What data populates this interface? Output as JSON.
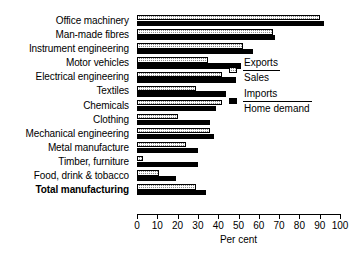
{
  "chart_data": {
    "type": "bar",
    "orientation": "horizontal",
    "title": "",
    "xlabel": "Per cent",
    "ylabel": "",
    "xlim": [
      0,
      100
    ],
    "xticks": [
      0,
      10,
      20,
      30,
      40,
      50,
      60,
      70,
      80,
      90,
      100
    ],
    "grid": false,
    "legend_position": "inside-right",
    "categories": [
      "Office machinery",
      "Man-made fibres",
      "Instrument engineering",
      "Motor vehicles",
      "Electrical engineering",
      "Textiles",
      "Chemicals",
      "Clothing",
      "Mechanical engineering",
      "Metal manufacture",
      "Timber, furniture",
      "Food, drink & tobacco",
      "Total manufacturing"
    ],
    "emphasized_categories": [
      "Total manufacturing"
    ],
    "series": [
      {
        "name": "Exports/Sales",
        "legend_numerator": "Exports",
        "legend_denominator": "Sales",
        "color": "#8a8a8a",
        "pattern": "hatched",
        "values": [
          90,
          67,
          52,
          35,
          42,
          29,
          42,
          20,
          36,
          24,
          3,
          11,
          29
        ]
      },
      {
        "name": "Imports/Home demand",
        "legend_numerator": "Imports",
        "legend_denominator": "Home demand",
        "color": "#000000",
        "pattern": "solid",
        "values": [
          92,
          68,
          57,
          51,
          49,
          44,
          39,
          36,
          38,
          30,
          30,
          19,
          34
        ]
      }
    ]
  },
  "legend": {
    "entries": [
      {
        "numerator": "Exports",
        "denominator": "Sales"
      },
      {
        "numerator": "Imports",
        "denominator": "Home demand"
      }
    ]
  },
  "axis": {
    "title": "Per cent",
    "ticks": [
      "0",
      "10",
      "20",
      "30",
      "40",
      "50",
      "60",
      "70",
      "80",
      "90",
      "100"
    ]
  }
}
